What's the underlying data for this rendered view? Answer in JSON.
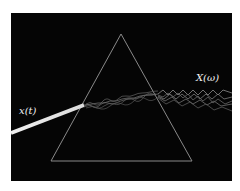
{
  "diagram": {
    "title": "",
    "labels": {
      "input": "x(t)",
      "output": "X(ω)"
    },
    "colors": {
      "background": "#050505",
      "prism_edge": "#8a8a8a",
      "beam": "#e8e8e8",
      "waves": "#9a9a9a",
      "label": "#f2f2f2"
    }
  }
}
